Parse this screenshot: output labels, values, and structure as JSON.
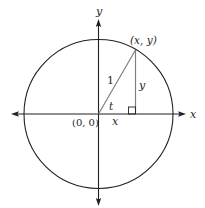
{
  "diagram": {
    "colors": {
      "stroke": "#231f20",
      "gray_line": "#808080",
      "background": "#ffffff"
    },
    "axes": {
      "x_label": "x",
      "y_label": "y"
    },
    "circle": {
      "radius_label": "1"
    },
    "labels": {
      "origin": "(0, 0)",
      "point": "(x, y)",
      "angle": "t",
      "horizontal_leg": "x",
      "vertical_leg": "y"
    }
  }
}
